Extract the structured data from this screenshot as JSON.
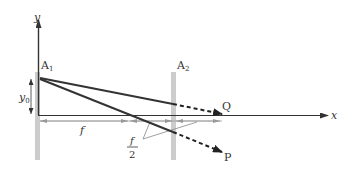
{
  "diagram": {
    "type": "optics-two-screen",
    "axes": {
      "x_label": "x",
      "y_label": "y"
    },
    "screens": [
      {
        "name": "A",
        "subscript": "1",
        "position": "x = 0"
      },
      {
        "name": "A",
        "subscript": "2",
        "position": "x = 3f/2"
      }
    ],
    "rays": [
      {
        "label": "Q",
        "style": "solid then dashed"
      },
      {
        "label": "P",
        "style": "solid then dashed"
      }
    ],
    "dimensions": {
      "height": {
        "label_base": "y",
        "label_sub": "0"
      },
      "distance_f": "f",
      "half_f": {
        "numerator": "f",
        "denominator": "2"
      }
    },
    "colors": {
      "line": "#333333",
      "screen": "#cccccc",
      "dimension": "#999999"
    }
  }
}
